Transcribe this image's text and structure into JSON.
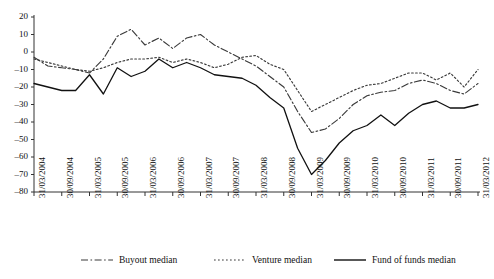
{
  "chart_data": {
    "type": "line",
    "title": "",
    "xlabel": "",
    "ylabel": "",
    "ylim": [
      -80,
      20
    ],
    "ytick_step": 10,
    "yticks": [
      20,
      10,
      0,
      -10,
      -20,
      -30,
      -40,
      -50,
      -60,
      -70,
      -80
    ],
    "grid": false,
    "legend_position": "bottom",
    "x_tick_labels": [
      "31/03/2004",
      "30/09/2004",
      "31/03/2005",
      "30/09/2005",
      "31/03/2006",
      "30/09/2006",
      "31/03/2007",
      "30/09/2007",
      "31/03/2008",
      "30/09/2008",
      "31/03/2009",
      "30/09/2009",
      "31/03/2010",
      "30/09/2010",
      "31/03/2011",
      "30/09/2011",
      "31/03/2012"
    ],
    "x": [
      "31/03/2004",
      "30/06/2004",
      "30/09/2004",
      "31/12/2004",
      "31/03/2005",
      "30/06/2005",
      "30/09/2005",
      "31/12/2005",
      "31/03/2006",
      "30/06/2006",
      "30/09/2006",
      "31/12/2006",
      "31/03/2007",
      "30/06/2007",
      "30/09/2007",
      "31/12/2007",
      "31/03/2008",
      "30/06/2008",
      "30/09/2008",
      "31/12/2008",
      "31/03/2009",
      "30/06/2009",
      "30/09/2009",
      "31/12/2009",
      "31/03/2010",
      "30/06/2010",
      "30/09/2010",
      "31/12/2010",
      "31/03/2011",
      "30/06/2011",
      "30/09/2011",
      "31/12/2011",
      "31/03/2012"
    ],
    "series": [
      {
        "name": "Buyout median",
        "style": "dash-dot",
        "color": "#3a3a3a",
        "values": [
          -3,
          -8,
          -9,
          -10,
          -12,
          -4,
          9,
          13,
          4,
          8,
          2,
          8,
          10,
          4,
          0,
          -4,
          -8,
          -14,
          -20,
          -34,
          -46,
          -44,
          -38,
          -30,
          -25,
          -23,
          -22,
          -18,
          -16,
          -18,
          -22,
          -24,
          -18
        ]
      },
      {
        "name": "Venture median",
        "style": "dotted",
        "color": "#3a3a3a",
        "values": [
          -4,
          -6,
          -8,
          -10,
          -11,
          -9,
          -6,
          -4,
          -4,
          -3,
          -6,
          -4,
          -6,
          -9,
          -7,
          -3,
          -2,
          -7,
          -10,
          -22,
          -34,
          -30,
          -26,
          -22,
          -19,
          -18,
          -15,
          -12,
          -12,
          -16,
          -12,
          -20,
          -10
        ]
      },
      {
        "name": "Fund of funds median",
        "style": "solid",
        "color": "#111111",
        "values": [
          -18,
          -20,
          -22,
          -22,
          -13,
          -24,
          -9,
          -14,
          -11,
          -4,
          -9,
          -6,
          -9,
          -13,
          -14,
          -15,
          -19,
          -26,
          -32,
          -55,
          -70,
          -62,
          -52,
          -45,
          -42,
          -36,
          -42,
          -35,
          -30,
          -28,
          -32,
          -32,
          -30
        ]
      }
    ]
  },
  "axis": {
    "y_labels": [
      "20",
      "10",
      "0",
      "-10",
      "-20",
      "-30",
      "-40",
      "-50",
      "-60",
      "-70",
      "-80"
    ]
  },
  "legend": {
    "items": [
      {
        "label": "Buyout median",
        "style": "dash-dot"
      },
      {
        "label": "Venture median",
        "style": "dotted"
      },
      {
        "label": "Fund of funds median",
        "style": "solid"
      }
    ]
  }
}
